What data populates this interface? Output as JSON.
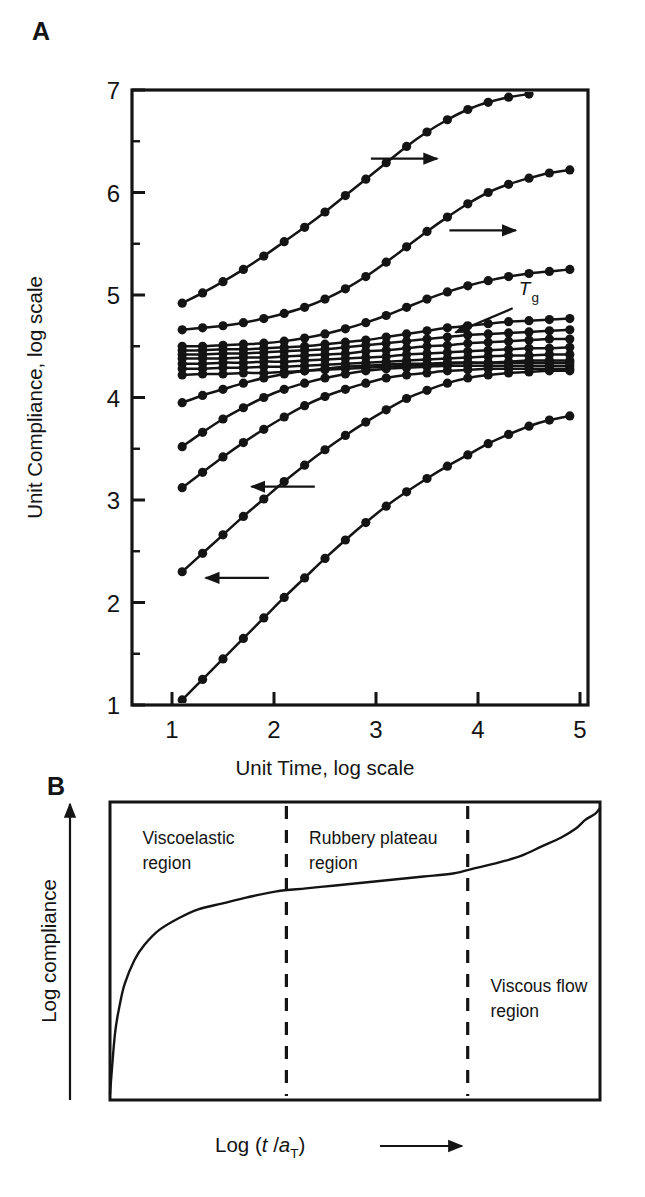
{
  "figure": {
    "panels": [
      {
        "letter": "A",
        "name": "master-curve-panel"
      },
      {
        "letter": "B",
        "name": "schematic-panel"
      }
    ]
  },
  "panel_a": {
    "letter": "A",
    "y_axis_title": "Unit Compliance, log scale",
    "x_axis_title": "Unit Time, log scale",
    "y_ticks": [
      "1",
      "2",
      "3",
      "4",
      "5",
      "6",
      "7"
    ],
    "x_ticks": [
      "1",
      "2",
      "3",
      "4",
      "5"
    ],
    "annotation_tg": "T",
    "annotation_tg_sub": "g",
    "arrow_right_count": 2,
    "arrow_left_count": 2
  },
  "panel_b": {
    "letter": "B",
    "y_axis_title": "Log compliance",
    "x_axis_title_prefix": "Log (",
    "x_axis_title_t": "t",
    "x_axis_title_slash": " /",
    "x_axis_title_a": "a",
    "x_axis_title_sub": "T",
    "x_axis_title_close": ")",
    "regions": [
      {
        "line1": "Viscoelastic",
        "line2": "region"
      },
      {
        "line1": "Rubbery plateau",
        "line2": "region"
      },
      {
        "line1": "Viscous flow",
        "line2": "region"
      }
    ]
  },
  "chart_data": [
    {
      "type": "line",
      "title": "",
      "xlabel": "Unit Time, log scale",
      "ylabel": "Unit Compliance, log scale",
      "xlim": [
        0.6,
        5.15
      ],
      "ylim": [
        1.0,
        7.0
      ],
      "xticks": [
        1,
        2,
        3,
        4,
        5
      ],
      "yticks": [
        1,
        2,
        3,
        4,
        5,
        6,
        7
      ],
      "minor_yticks": [
        1.5,
        2.5,
        3.5,
        4.5,
        5.5,
        6.5
      ],
      "grid": false,
      "legend": null,
      "markers": "filled-circle",
      "annotations": [
        {
          "text": "Tg",
          "x": 4.45,
          "y": 4.92,
          "arrow_to_x": 3.85,
          "arrow_to_y": 4.62
        },
        {
          "text": "arrow-right",
          "x": 3.25,
          "y": 6.32
        },
        {
          "text": "arrow-right",
          "x": 4.0,
          "y": 5.63
        },
        {
          "text": "arrow-left",
          "x": 2.1,
          "y": 3.12
        },
        {
          "text": "arrow-left",
          "x": 1.6,
          "y": 2.22
        }
      ],
      "series": [
        {
          "name": "T1",
          "x": [
            1.1,
            1.3,
            1.5,
            1.7,
            1.9,
            2.1,
            2.3,
            2.5,
            2.7,
            2.9,
            3.1,
            3.3,
            3.5,
            3.7,
            3.9,
            4.1,
            4.3,
            4.5
          ],
          "y": [
            4.92,
            5.02,
            5.13,
            5.25,
            5.38,
            5.52,
            5.66,
            5.81,
            5.97,
            6.13,
            6.29,
            6.45,
            6.59,
            6.71,
            6.81,
            6.88,
            6.93,
            6.96
          ]
        },
        {
          "name": "T2",
          "x": [
            1.1,
            1.3,
            1.5,
            1.7,
            1.9,
            2.1,
            2.3,
            2.5,
            2.7,
            2.9,
            3.1,
            3.3,
            3.5,
            3.7,
            3.9,
            4.1,
            4.3,
            4.5,
            4.7,
            4.9
          ],
          "y": [
            4.66,
            4.68,
            4.7,
            4.73,
            4.77,
            4.82,
            4.88,
            4.96,
            5.06,
            5.18,
            5.32,
            5.47,
            5.62,
            5.76,
            5.89,
            6.0,
            6.08,
            6.14,
            6.19,
            6.22
          ]
        },
        {
          "name": "T3",
          "x": [
            1.1,
            1.3,
            1.5,
            1.7,
            1.9,
            2.1,
            2.3,
            2.5,
            2.7,
            2.9,
            3.1,
            3.3,
            3.5,
            3.7,
            3.9,
            4.1,
            4.3,
            4.5,
            4.7,
            4.9
          ],
          "y": [
            4.5,
            4.5,
            4.51,
            4.52,
            4.53,
            4.55,
            4.58,
            4.62,
            4.67,
            4.73,
            4.8,
            4.88,
            4.96,
            5.03,
            5.09,
            5.14,
            5.18,
            5.21,
            5.23,
            5.25
          ]
        },
        {
          "name": "T4-Tg",
          "x": [
            1.1,
            1.3,
            1.5,
            1.7,
            1.9,
            2.1,
            2.3,
            2.5,
            2.7,
            2.9,
            3.1,
            3.3,
            3.5,
            3.7,
            3.9,
            4.1,
            4.3,
            4.5,
            4.7,
            4.9
          ],
          "y": [
            4.46,
            4.46,
            4.47,
            4.47,
            4.48,
            4.49,
            4.5,
            4.52,
            4.54,
            4.56,
            4.59,
            4.62,
            4.65,
            4.68,
            4.7,
            4.72,
            4.74,
            4.75,
            4.76,
            4.77
          ]
        },
        {
          "name": "T5",
          "x": [
            1.1,
            1.3,
            1.5,
            1.7,
            1.9,
            2.1,
            2.3,
            2.5,
            2.7,
            2.9,
            3.1,
            3.3,
            3.5,
            3.7,
            3.9,
            4.1,
            4.3,
            4.5,
            4.7,
            4.9
          ],
          "y": [
            4.42,
            4.42,
            4.43,
            4.43,
            4.44,
            4.45,
            4.46,
            4.47,
            4.49,
            4.51,
            4.53,
            4.55,
            4.57,
            4.59,
            4.61,
            4.62,
            4.63,
            4.64,
            4.65,
            4.66
          ]
        },
        {
          "name": "T6",
          "x": [
            1.1,
            1.3,
            1.5,
            1.7,
            1.9,
            2.1,
            2.3,
            2.5,
            2.7,
            2.9,
            3.1,
            3.3,
            3.5,
            3.7,
            3.9,
            4.1,
            4.3,
            4.5,
            4.7,
            4.9
          ],
          "y": [
            4.38,
            4.38,
            4.38,
            4.39,
            4.39,
            4.4,
            4.41,
            4.42,
            4.43,
            4.45,
            4.46,
            4.48,
            4.5,
            4.51,
            4.53,
            4.54,
            4.55,
            4.56,
            4.57,
            4.57
          ]
        },
        {
          "name": "T7",
          "x": [
            1.1,
            1.3,
            1.5,
            1.7,
            1.9,
            2.1,
            2.3,
            2.5,
            2.7,
            2.9,
            3.1,
            3.3,
            3.5,
            3.7,
            3.9,
            4.1,
            4.3,
            4.5,
            4.7,
            4.9
          ],
          "y": [
            4.33,
            4.33,
            4.34,
            4.34,
            4.35,
            4.35,
            4.36,
            4.37,
            4.38,
            4.39,
            4.4,
            4.42,
            4.43,
            4.44,
            4.45,
            4.46,
            4.47,
            4.48,
            4.48,
            4.49
          ]
        },
        {
          "name": "T8",
          "x": [
            1.1,
            1.3,
            1.5,
            1.7,
            1.9,
            2.1,
            2.3,
            2.5,
            2.7,
            2.9,
            3.1,
            3.3,
            3.5,
            3.7,
            3.9,
            4.1,
            4.3,
            4.5,
            4.7,
            4.9
          ],
          "y": [
            4.28,
            4.28,
            4.29,
            4.29,
            4.3,
            4.3,
            4.31,
            4.32,
            4.33,
            4.34,
            4.35,
            4.36,
            4.37,
            4.38,
            4.39,
            4.4,
            4.41,
            4.41,
            4.42,
            4.42
          ]
        },
        {
          "name": "T9",
          "x": [
            1.1,
            1.3,
            1.5,
            1.7,
            1.9,
            2.1,
            2.3,
            2.5,
            2.7,
            2.9,
            3.1,
            3.3,
            3.5,
            3.7,
            3.9,
            4.1,
            4.3,
            4.5,
            4.7,
            4.9
          ],
          "y": [
            4.22,
            4.23,
            4.23,
            4.24,
            4.24,
            4.25,
            4.26,
            4.27,
            4.28,
            4.29,
            4.3,
            4.31,
            4.32,
            4.33,
            4.34,
            4.34,
            4.35,
            4.36,
            4.36,
            4.36
          ]
        },
        {
          "name": "T10",
          "x": [
            1.1,
            1.3,
            1.5,
            1.7,
            1.9,
            2.1,
            2.3,
            2.5,
            2.7,
            2.9,
            3.1,
            3.3,
            3.5,
            3.7,
            3.9,
            4.1,
            4.3,
            4.5,
            4.7,
            4.9
          ],
          "y": [
            3.95,
            4.02,
            4.08,
            4.14,
            4.19,
            4.23,
            4.26,
            4.28,
            4.3,
            4.31,
            4.32,
            4.33,
            4.33,
            4.34,
            4.34,
            4.34,
            4.34,
            4.34,
            4.34,
            4.34
          ]
        },
        {
          "name": "T11",
          "x": [
            1.1,
            1.3,
            1.5,
            1.7,
            1.9,
            2.1,
            2.3,
            2.5,
            2.7,
            2.9,
            3.1,
            3.3,
            3.5,
            3.7,
            3.9,
            4.1,
            4.3,
            4.5,
            4.7,
            4.9
          ],
          "y": [
            3.52,
            3.66,
            3.79,
            3.9,
            4.0,
            4.08,
            4.14,
            4.19,
            4.23,
            4.26,
            4.28,
            4.29,
            4.3,
            4.31,
            4.31,
            4.31,
            4.31,
            4.31,
            4.31,
            4.31
          ]
        },
        {
          "name": "T12",
          "x": [
            1.1,
            1.3,
            1.5,
            1.7,
            1.9,
            2.1,
            2.3,
            2.5,
            2.7,
            2.9,
            3.1,
            3.3,
            3.5,
            3.7,
            3.9,
            4.1,
            4.3,
            4.5,
            4.7,
            4.9
          ],
          "y": [
            3.12,
            3.27,
            3.42,
            3.56,
            3.69,
            3.81,
            3.92,
            4.01,
            4.08,
            4.14,
            4.19,
            4.22,
            4.24,
            4.26,
            4.27,
            4.28,
            4.28,
            4.28,
            4.28,
            4.28
          ]
        },
        {
          "name": "T13",
          "x": [
            1.1,
            1.3,
            1.5,
            1.7,
            1.9,
            2.1,
            2.3,
            2.5,
            2.7,
            2.9,
            3.1,
            3.3,
            3.5,
            3.7,
            3.9,
            4.1,
            4.3,
            4.5,
            4.7,
            4.9
          ],
          "y": [
            2.3,
            2.48,
            2.66,
            2.84,
            3.01,
            3.18,
            3.34,
            3.49,
            3.63,
            3.76,
            3.88,
            3.99,
            4.07,
            4.14,
            4.19,
            4.22,
            4.24,
            4.25,
            4.26,
            4.26
          ]
        },
        {
          "name": "T14",
          "x": [
            1.1,
            1.3,
            1.5,
            1.7,
            1.9,
            2.1,
            2.3,
            2.5,
            2.7,
            2.9,
            3.1,
            3.3,
            3.5,
            3.7,
            3.9,
            4.1,
            4.3,
            4.5,
            4.7,
            4.9
          ],
          "y": [
            1.05,
            1.25,
            1.45,
            1.65,
            1.85,
            2.05,
            2.24,
            2.43,
            2.61,
            2.78,
            2.94,
            3.08,
            3.21,
            3.33,
            3.44,
            3.55,
            3.64,
            3.72,
            3.78,
            3.82
          ]
        }
      ]
    },
    {
      "type": "line",
      "title": "",
      "xlabel": "Log (t /aT)",
      "ylabel": "Log compliance",
      "xlim": [
        0,
        100
      ],
      "ylim": [
        0,
        100
      ],
      "grid": false,
      "legend": null,
      "region_dividers_x": [
        36,
        73
      ],
      "curve_x": [
        0,
        1,
        2,
        3,
        5,
        7,
        10,
        14,
        18,
        23,
        28,
        34,
        40,
        46,
        52,
        58,
        64,
        70,
        75,
        80,
        84,
        88,
        92,
        95,
        97,
        99,
        100
      ],
      "curve_y": [
        2,
        22,
        32,
        39,
        47,
        52,
        57,
        61,
        64,
        66,
        68,
        70,
        71,
        72,
        73,
        74,
        75,
        76,
        78,
        80,
        82,
        85,
        88,
        91,
        94,
        96,
        98
      ]
    }
  ]
}
